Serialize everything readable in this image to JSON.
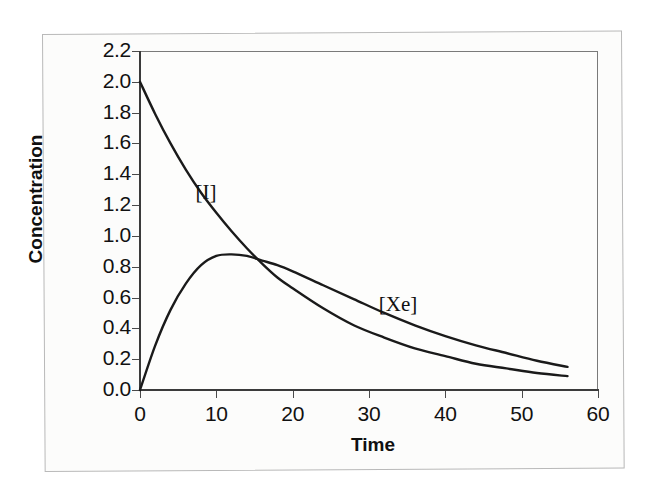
{
  "chart_data": {
    "type": "line",
    "title": "",
    "xlabel": "Time",
    "ylabel": "Concentration",
    "xlim": [
      0,
      60
    ],
    "ylim": [
      0.0,
      2.2
    ],
    "grid": false,
    "legend_position": "inline-annotations",
    "xticks": [
      "0",
      "10",
      "20",
      "30",
      "40",
      "50",
      "60"
    ],
    "xtick_values": [
      0,
      10,
      20,
      30,
      40,
      50,
      60
    ],
    "yticks": [
      "0.0",
      "0.2",
      "0.4",
      "0.6",
      "0.8",
      "1.0",
      "1.2",
      "1.4",
      "1.6",
      "1.8",
      "2.0",
      "2.2"
    ],
    "ytick_values": [
      0.0,
      0.2,
      0.4,
      0.6,
      0.8,
      1.0,
      1.2,
      1.4,
      1.6,
      1.8,
      2.0,
      2.2
    ],
    "annotations": [
      {
        "text": "[I]",
        "x": 9,
        "y": 1.45
      },
      {
        "text": "[Xe]",
        "x": 34,
        "y": 0.72
      }
    ],
    "series": [
      {
        "name": "[I]",
        "label": "[I]",
        "color": "#1a1a1a",
        "x": [
          0,
          2,
          4,
          6,
          8,
          10,
          12,
          14,
          16,
          18,
          20,
          24,
          28,
          32,
          36,
          40,
          44,
          48,
          52,
          56
        ],
        "values": [
          2.0,
          1.79,
          1.6,
          1.43,
          1.28,
          1.15,
          1.03,
          0.92,
          0.82,
          0.73,
          0.66,
          0.53,
          0.42,
          0.34,
          0.27,
          0.22,
          0.17,
          0.14,
          0.11,
          0.09
        ]
      },
      {
        "name": "[Xe]",
        "label": "[Xe]",
        "color": "#1a1a1a",
        "x": [
          0,
          2,
          4,
          6,
          8,
          10,
          12,
          14,
          16,
          18,
          20,
          24,
          28,
          32,
          36,
          40,
          44,
          48,
          52,
          56
        ],
        "values": [
          0.0,
          0.29,
          0.52,
          0.69,
          0.81,
          0.87,
          0.88,
          0.87,
          0.84,
          0.81,
          0.77,
          0.68,
          0.59,
          0.5,
          0.42,
          0.35,
          0.29,
          0.24,
          0.19,
          0.15
        ]
      }
    ]
  }
}
